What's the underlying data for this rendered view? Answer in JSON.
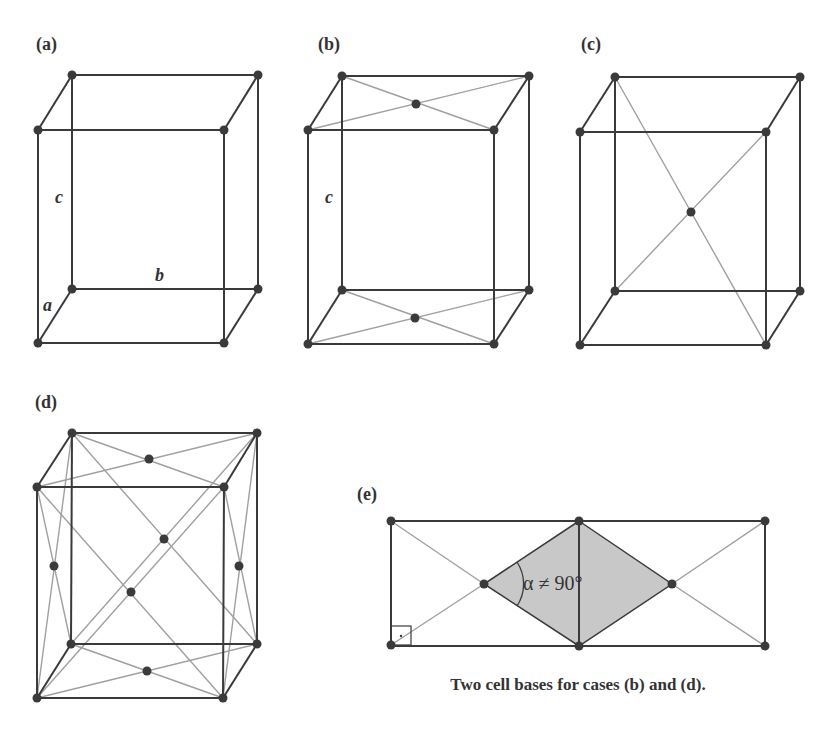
{
  "panels": {
    "a": {
      "label": "(a)",
      "axis_c": "c",
      "axis_b": "b",
      "axis_a": "a"
    },
    "b": {
      "label": "(b)",
      "axis_c": "c"
    },
    "c": {
      "label": "(c)"
    },
    "d": {
      "label": "(d)"
    },
    "e": {
      "label": "(e)",
      "angle_label": "α ≠ 90°",
      "caption": "Two cell bases for cases (b) and (d)."
    }
  },
  "colors": {
    "edge": "#3a3a3a",
    "diagonal": "#a0a0a0",
    "shaded": "#c8c8c8"
  }
}
